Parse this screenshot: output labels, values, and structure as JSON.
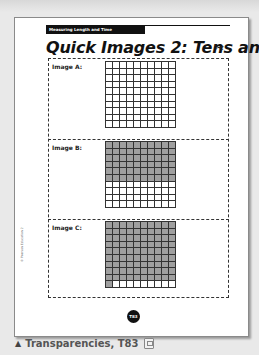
{
  "page": {
    "header_tag": "Measuring Length and Time",
    "title": "Quick Images 2: Tens and Ones",
    "copyright_vertical": "© Pearson Education 2",
    "page_badge": "T83"
  },
  "images": [
    {
      "label": "Image A:",
      "rows": 10,
      "cols": 10,
      "shaded_cells": 0
    },
    {
      "label": "Image B:",
      "rows": 10,
      "cols": 10,
      "shaded_cells": 60
    },
    {
      "label": "Image C:",
      "rows": 10,
      "cols": 10,
      "shaded_cells": 91
    }
  ],
  "caption": {
    "marker": "▲",
    "text": "Transparencies, T83"
  },
  "colors": {
    "shaded": "#9f9f9f",
    "header_bar": "#111111",
    "background": "#e9e9e9"
  }
}
